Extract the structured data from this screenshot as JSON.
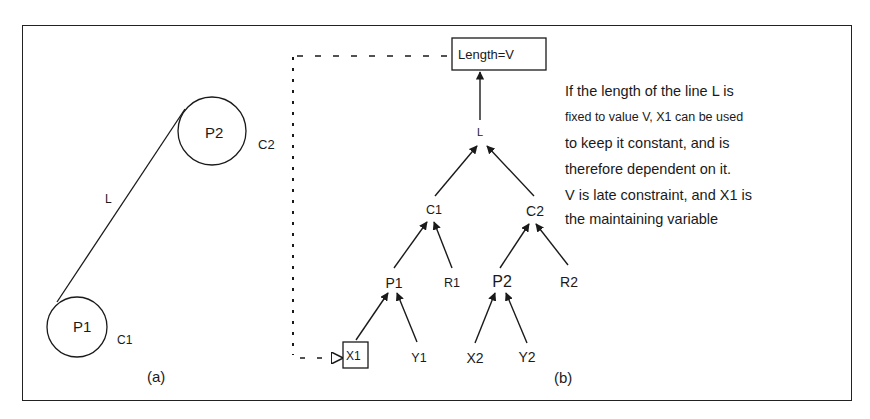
{
  "figure": {
    "panel_a": {
      "caption": "(a)",
      "circles": [
        {
          "id": "c1",
          "label": "P1",
          "circle_label": "C1"
        },
        {
          "id": "c2",
          "label": "P2",
          "circle_label": "C2"
        }
      ],
      "line_label": "L"
    },
    "panel_b": {
      "caption": "(b)",
      "root_box": "Length=V",
      "nodes": {
        "L": "L",
        "C1": "C1",
        "C2": "C2",
        "P1": "P1",
        "R1": "R1",
        "P2": "P2",
        "R2": "R2",
        "X1": "X1",
        "Y1": "Y1",
        "X2": "X2",
        "Y2": "Y2"
      }
    },
    "description": [
      "If the length of the line L is",
      "fixed to value V, X1 can be used",
      "to keep it constant, and is",
      "therefore dependent on it.",
      "V is late constraint, and X1 is",
      "the maintaining variable"
    ],
    "colors": {
      "ink": "#1a1a1a",
      "background": "#ffffff"
    }
  }
}
